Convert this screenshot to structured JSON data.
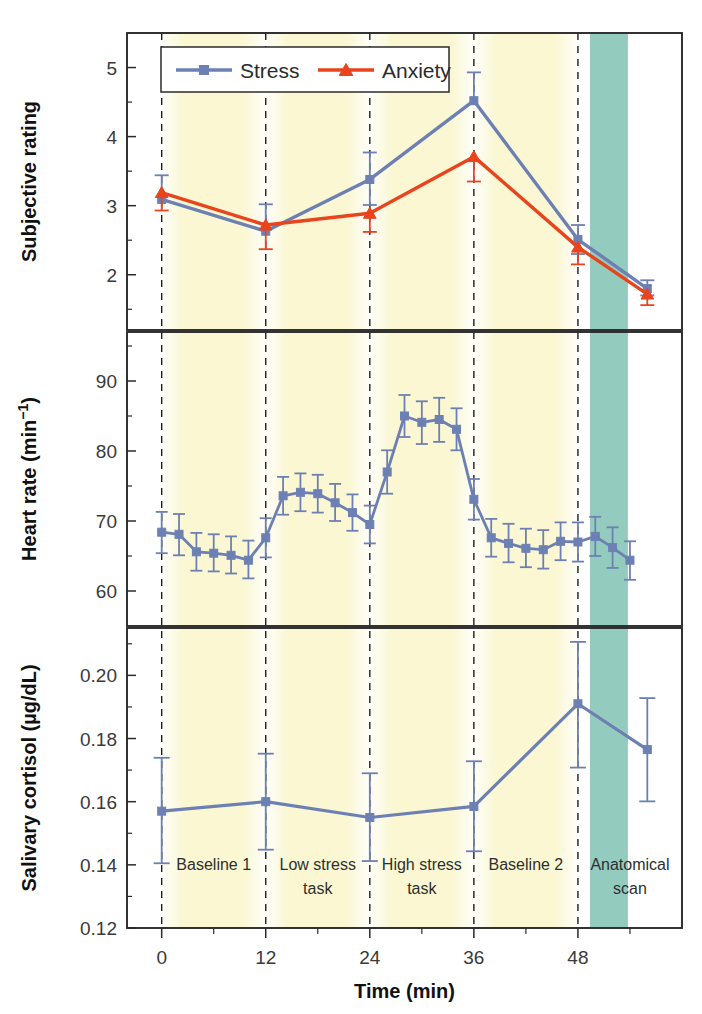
{
  "figure": {
    "xlabel": "Time (min)",
    "xticks": [
      0,
      12,
      24,
      36,
      48
    ],
    "xlim": [
      -4,
      60
    ],
    "phases": [
      {
        "label_line1": "Baseline 1",
        "label_line2": "",
        "start": 0,
        "end": 12,
        "band": "yellow"
      },
      {
        "label_line1": "Low stress",
        "label_line2": "task",
        "start": 12,
        "end": 24,
        "band": "yellow"
      },
      {
        "label_line1": "High stress",
        "label_line2": "task",
        "start": 24,
        "end": 36,
        "band": "yellow"
      },
      {
        "label_line1": "Baseline 2",
        "label_line2": "",
        "start": 36,
        "end": 48,
        "band": "yellow"
      },
      {
        "label_line1": "Anatomical",
        "label_line2": "scan",
        "start": 48,
        "end": 60,
        "band": "teal"
      }
    ],
    "dividers_min": [
      0,
      12,
      24,
      36,
      48
    ],
    "colors": {
      "stress_blue": "#6d80b4",
      "anxiety_red": "#e8441d",
      "band_yellow": "#faf7d2",
      "band_teal": "#93ccbe",
      "axis": "#2b2b2b"
    }
  },
  "chart_data": [
    {
      "type": "line",
      "panel": "top",
      "title": "",
      "ylabel": "Subjective rating",
      "xlabel": "Time (min)",
      "ylim": [
        1.2,
        5.5
      ],
      "yticks": [
        2,
        3,
        4,
        5
      ],
      "yminor": [
        1.5,
        2.5,
        3.5,
        4.5
      ],
      "grid": false,
      "legend_position": "top-left",
      "x": [
        0,
        12,
        24,
        36,
        48,
        56
      ],
      "series": [
        {
          "name": "Stress",
          "color": "#6d80b4",
          "marker": "square",
          "values": [
            3.09,
            2.63,
            3.38,
            4.52,
            2.51,
            1.8
          ],
          "err_low": [
            3.09,
            2.63,
            3.01,
            4.52,
            2.3,
            1.7
          ],
          "err_high": [
            3.44,
            3.02,
            3.77,
            4.93,
            2.72,
            1.92
          ]
        },
        {
          "name": "Anxiety",
          "color": "#e8441d",
          "marker": "triangle",
          "values": [
            3.19,
            2.72,
            2.89,
            3.71,
            2.4,
            1.72
          ],
          "err_low": [
            2.93,
            2.37,
            2.62,
            3.35,
            2.15,
            1.56
          ],
          "err_high": [
            3.19,
            2.72,
            2.89,
            3.71,
            2.4,
            1.72
          ]
        }
      ]
    },
    {
      "type": "line",
      "panel": "middle",
      "title": "",
      "ylabel": "Heart rate (min−1)",
      "ylabel_plain": "Heart rate (min-1)",
      "xlabel": "Time (min)",
      "ylim": [
        55,
        97
      ],
      "yticks": [
        60,
        70,
        80,
        90
      ],
      "yminor": [
        65,
        75,
        85,
        95
      ],
      "grid": false,
      "x": [
        0,
        2,
        4,
        6,
        8,
        10,
        12,
        14,
        16,
        18,
        20,
        22,
        24,
        26,
        28,
        30,
        32,
        34,
        36,
        38,
        40,
        42,
        44,
        46,
        48,
        50,
        52,
        54
      ],
      "series": [
        {
          "name": "Heart rate",
          "color": "#6d80b4",
          "marker": "square",
          "values": [
            68.4,
            68.1,
            65.6,
            65.4,
            65.1,
            64.4,
            67.6,
            73.6,
            74.1,
            73.9,
            72.6,
            71.2,
            69.5,
            77.0,
            85.0,
            84.1,
            84.5,
            83.1,
            73.1,
            67.6,
            66.8,
            66.1,
            65.9,
            67.1,
            67.0,
            67.8,
            66.2,
            64.4
          ],
          "err_low": [
            65.4,
            65.1,
            62.9,
            62.8,
            62.5,
            61.8,
            64.8,
            70.9,
            71.4,
            71.2,
            70.0,
            68.6,
            66.8,
            73.9,
            82.0,
            81.0,
            81.3,
            80.1,
            70.2,
            64.9,
            64.1,
            63.4,
            63.2,
            64.4,
            64.2,
            65.0,
            63.3,
            61.6
          ],
          "err_high": [
            71.3,
            71.0,
            68.3,
            68.1,
            67.8,
            67.2,
            70.4,
            76.3,
            76.8,
            76.6,
            75.3,
            73.8,
            72.2,
            80.1,
            88.0,
            87.1,
            87.6,
            86.1,
            76.0,
            70.3,
            69.6,
            68.9,
            68.7,
            69.8,
            69.8,
            70.6,
            69.1,
            67.1
          ]
        }
      ]
    },
    {
      "type": "line",
      "panel": "bottom",
      "title": "",
      "ylabel": "Salivary cortisol (µg/dL)",
      "ylabel_plain": "Salivary cortisol (ug/dL)",
      "xlabel": "Time (min)",
      "ylim": [
        0.12,
        0.215
      ],
      "yticks": [
        0.12,
        0.14,
        0.16,
        0.18,
        0.2
      ],
      "ytick_labels": [
        "0.12",
        "0.14",
        "0.16",
        "0.18",
        "0.20"
      ],
      "yminor": [
        0.13,
        0.15,
        0.17,
        0.19,
        0.21
      ],
      "grid": false,
      "x": [
        0,
        12,
        24,
        36,
        48,
        56
      ],
      "series": [
        {
          "name": "Salivary cortisol",
          "color": "#6d80b4",
          "marker": "square",
          "values": [
            0.157,
            0.16,
            0.155,
            0.1585,
            0.191,
            0.1765
          ],
          "err_low": [
            0.1405,
            0.1448,
            0.1412,
            0.1443,
            0.1708,
            0.1601
          ],
          "err_high": [
            0.1739,
            0.1752,
            0.169,
            0.1728,
            0.2106,
            0.1928
          ]
        }
      ]
    }
  ],
  "legend": {
    "items": [
      {
        "label": "Stress",
        "color": "#6d80b4",
        "marker": "square"
      },
      {
        "label": "Anxiety",
        "color": "#e8441d",
        "marker": "triangle"
      }
    ]
  }
}
